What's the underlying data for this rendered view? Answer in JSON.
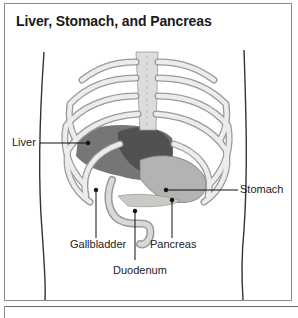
{
  "diagram": {
    "title": "Liver, Stomach, and Pancreas",
    "labels": {
      "liver": "Liver",
      "stomach": "Stomach",
      "gallbladder": "Gallbladder",
      "pancreas": "Pancreas",
      "duodenum": "Duodenum"
    },
    "colors": {
      "border": "#8a8a8a",
      "bone": "#e4e4e2",
      "bone_shade": "#a9a9a7",
      "liver": "#5e5e5e",
      "stomach": "#b3b3b1",
      "text": "#222222"
    }
  }
}
